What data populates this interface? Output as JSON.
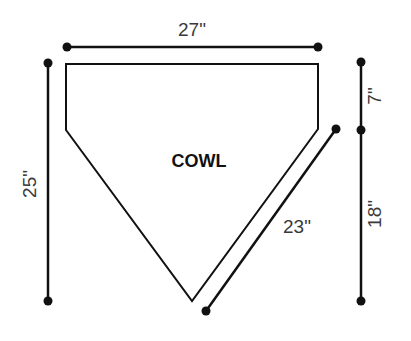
{
  "diagram": {
    "part": {
      "label": "COWL",
      "shape": "pentagon (home-plate shape, pointing down)"
    },
    "dimensions": {
      "top_width": "27\"",
      "left_height": "25\"",
      "right_upper_height": "7\"",
      "right_lower_height": "18\"",
      "diagonal_edge": "23\""
    },
    "colors": {
      "line": "#111111",
      "text": "#3a3a3a",
      "background": "#ffffff"
    }
  }
}
